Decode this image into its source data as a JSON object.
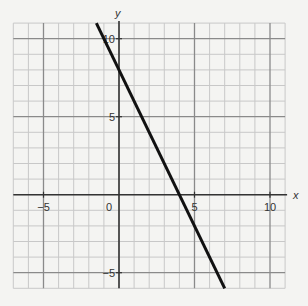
{
  "chart_data": {
    "type": "line",
    "title": "",
    "xlabel": "x",
    "ylabel": "y",
    "xlim": [
      -7,
      11
    ],
    "ylim": [
      -6,
      11
    ],
    "grid": true,
    "grid_step": 1,
    "major_step": 5,
    "x_ticks": [
      -5,
      5,
      10
    ],
    "x_tick_labels": [
      "−5",
      "5",
      "10"
    ],
    "y_ticks": [
      10,
      5,
      -5
    ],
    "y_tick_labels": [
      "10",
      "5",
      "−5"
    ],
    "origin_label": "0",
    "series": [
      {
        "name": "line",
        "equation": "y = -2x + 8",
        "slope": -2,
        "intercept": 8,
        "x": [
          -1.5,
          7
        ],
        "y": [
          11,
          -6
        ],
        "x_intercept": 4,
        "y_intercept": 8,
        "color": "#111111"
      }
    ]
  },
  "colors": {
    "background": "#f4f4f2",
    "minor_grid": "#c8c8c8",
    "major_grid": "#8a8a8a",
    "axis": "#333333",
    "line": "#111111"
  }
}
